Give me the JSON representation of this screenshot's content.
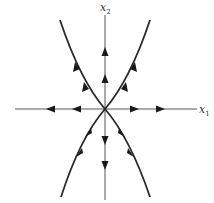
{
  "diagram": {
    "type": "phase-portrait",
    "axes": {
      "x1": {
        "label": "x",
        "subscript": "1"
      },
      "x2": {
        "label": "x",
        "subscript": "2"
      }
    },
    "origin": [
      105,
      109
    ],
    "trajectories": [
      {
        "name": "positive-x2-axis",
        "direction": "outward"
      },
      {
        "name": "negative-x2-axis",
        "direction": "outward"
      },
      {
        "name": "positive-x1-axis",
        "direction": "outward"
      },
      {
        "name": "negative-x1-axis",
        "direction": "outward"
      },
      {
        "name": "upper-left-parabola",
        "direction": "outward"
      },
      {
        "name": "upper-right-parabola",
        "direction": "outward"
      },
      {
        "name": "lower-left-parabola",
        "direction": "outward"
      },
      {
        "name": "lower-right-parabola",
        "direction": "outward"
      }
    ],
    "colors": {
      "axis": "#555555",
      "curve": "#2a2a2a",
      "arrow": "#1a1a1a",
      "background": "#ffffff"
    }
  }
}
